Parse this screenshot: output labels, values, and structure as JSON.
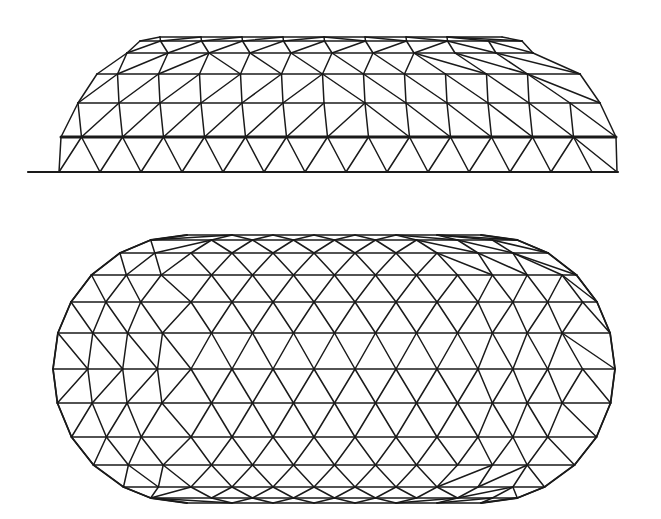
{
  "figure": {
    "description": "Elongated geodesic dome: elevation (side view) above, plan (top view) below",
    "background": "#ffffff",
    "stroke_color": "#1a1a1a",
    "stroke_width": 1.5
  },
  "side_view": {
    "name": "elevation",
    "ground_line": {
      "x1": 28,
      "x2": 618,
      "y": 172,
      "width": 2.2
    },
    "spacing": 41,
    "rows": [
      {
        "y": 37,
        "xl": 160,
        "xr": 502,
        "w": 1.6
      },
      {
        "y": 41,
        "xl": 140,
        "xr": 522,
        "w": 1.6
      },
      {
        "y": 53,
        "xl": 127,
        "xr": 533,
        "w": 1.7
      },
      {
        "y": 74,
        "xl": 97,
        "xr": 580,
        "w": 1.7
      },
      {
        "y": 103,
        "xl": 78,
        "xr": 600,
        "w": 1.7
      },
      {
        "y": 137,
        "xl": 61,
        "xr": 616,
        "w": 3.0
      },
      {
        "y": 172,
        "xl": 59,
        "xr": 617,
        "w": 2.2
      }
    ]
  },
  "top_view": {
    "name": "plan",
    "outline": {
      "cx_left": 187,
      "cx_right": 481,
      "cy": 369,
      "r": 134
    },
    "spacing": 41,
    "rows": [
      235,
      240,
      253,
      275,
      302,
      333,
      369,
      403,
      437,
      465,
      487,
      498,
      503
    ]
  }
}
